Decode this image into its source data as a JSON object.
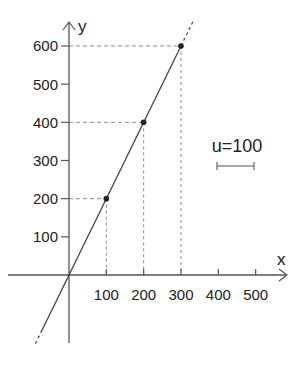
{
  "chart_data": {
    "type": "line",
    "title": "",
    "xlabel": "x",
    "ylabel": "y",
    "x_ticks": [
      100,
      200,
      300,
      400,
      500
    ],
    "y_ticks": [
      100,
      200,
      300,
      400,
      500,
      600
    ],
    "x_tick_labels": [
      "100",
      "200",
      "300",
      "400",
      "500"
    ],
    "y_tick_labels": [
      "100",
      "200",
      "300",
      "400",
      "500",
      "600"
    ],
    "xlim": [
      -165,
      590
    ],
    "ylim": [
      -180,
      665
    ],
    "grid": false,
    "legend": null,
    "series": [
      {
        "name": "y = 2x",
        "slope": 2,
        "intercept": 0,
        "x": [
          0,
          100,
          200,
          300
        ],
        "values": [
          0,
          200,
          400,
          600
        ],
        "style": "solid line through origin, dashed extensions beyond"
      }
    ],
    "marked_points": [
      {
        "x": 100,
        "y": 200
      },
      {
        "x": 200,
        "y": 400
      },
      {
        "x": 300,
        "y": 600
      }
    ],
    "annotations": [
      {
        "text": "u=100",
        "type": "scale-bar",
        "length_units": 100
      }
    ]
  },
  "labels": {
    "x_axis": "x",
    "y_axis": "y",
    "unit": "u=100"
  },
  "colors": {
    "axis": "#555555",
    "line": "#444444",
    "guide": "#8a8a8a",
    "point": "#222222",
    "text": "#222222"
  }
}
